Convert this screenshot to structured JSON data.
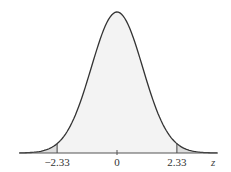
{
  "chart_data": {
    "type": "area",
    "title": "",
    "xlabel": "z",
    "ylabel": "",
    "x_ticks": [
      {
        "value": -2.33,
        "label": "−2.33"
      },
      {
        "value": 0,
        "label": "0"
      },
      {
        "value": 2.33,
        "label": "2.33"
      }
    ],
    "xlim": [
      -3.8,
      3.9
    ],
    "shaded_regions": [
      {
        "from": -3.8,
        "to": -2.33,
        "label": "left tail"
      },
      {
        "from": 2.33,
        "to": 3.9,
        "label": "right tail"
      }
    ],
    "curve": "standard normal density",
    "grid": false,
    "legend": "none",
    "colors": {
      "curve": "#333333",
      "body_fill": "#f2f2f2",
      "tail_fill": "#dcdcdc",
      "axis": "#555555"
    }
  },
  "labels": {
    "axis_var": "z",
    "tick_left": "−2.33",
    "tick_center": "0",
    "tick_right": "2.33"
  }
}
